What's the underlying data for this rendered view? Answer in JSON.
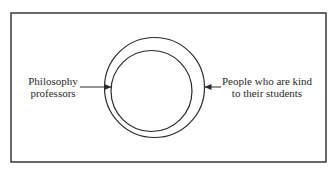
{
  "diagram": {
    "type": "euler-diagram",
    "colors": {
      "stroke": "#2a2a2a",
      "background": "#ffffff"
    },
    "frame": {
      "x": 11,
      "y": 13,
      "width": 315,
      "height": 149
    },
    "outer_circle": {
      "cx": 154.5,
      "cy": 87.5,
      "r": 50
    },
    "inner_circle": {
      "cx": 151.5,
      "cy": 91,
      "r": 40.5
    },
    "labels": {
      "left": {
        "line1": "Philosophy",
        "line2": "professors"
      },
      "right": {
        "line1": "People who are kind",
        "line2": "to their students"
      }
    },
    "arrows": {
      "left": {
        "x1": 80,
        "y1": 87,
        "x2": 111,
        "y2": 87,
        "target": "inner_circle"
      },
      "right": {
        "x1": 221,
        "y1": 87,
        "x2": 205,
        "y2": 87,
        "target": "outer_circle"
      }
    }
  }
}
